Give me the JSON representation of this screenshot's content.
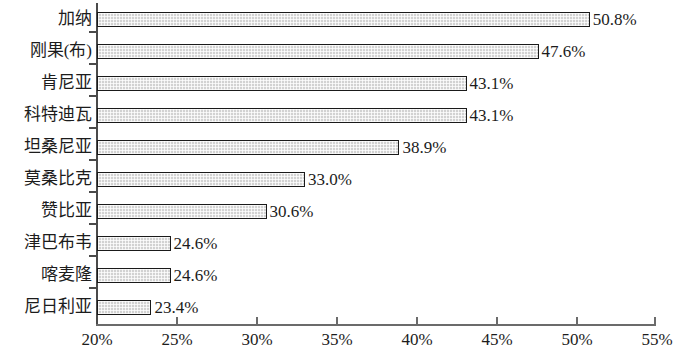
{
  "chart_data": {
    "type": "bar",
    "orientation": "horizontal",
    "title": "",
    "subtitle": "",
    "xlabel": "",
    "ylabel": "",
    "xlim": [
      20,
      55
    ],
    "xticks": [
      20,
      25,
      30,
      35,
      40,
      45,
      50,
      55
    ],
    "xtick_labels": [
      "20%",
      "25%",
      "30%",
      "35%",
      "40%",
      "45%",
      "50%",
      "55%"
    ],
    "grid": false,
    "legend": null,
    "categories": [
      "加纳",
      "刚果(布)",
      "肯尼亚",
      "科特迪瓦",
      "坦桑尼亚",
      "莫桑比克",
      "赞比亚",
      "津巴布韦",
      "喀麦隆",
      "尼日利亚"
    ],
    "values": [
      50.8,
      47.6,
      43.1,
      43.1,
      38.9,
      33.0,
      30.6,
      24.6,
      24.6,
      23.4
    ],
    "value_labels": [
      "50.8%",
      "47.6%",
      "43.1%",
      "43.1%",
      "38.9%",
      "33.0%",
      "30.6%",
      "24.6%",
      "24.6%",
      "23.4%"
    ],
    "bars": [
      {
        "category": "加纳",
        "value": 50.8,
        "label": "50.8%"
      },
      {
        "category": "刚果(布)",
        "value": 47.6,
        "label": "47.6%"
      },
      {
        "category": "肯尼亚",
        "value": 43.1,
        "label": "43.1%"
      },
      {
        "category": "科特迪瓦",
        "value": 43.1,
        "label": "43.1%"
      },
      {
        "category": "坦桑尼亚",
        "value": 38.9,
        "label": "38.9%"
      },
      {
        "category": "莫桑比克",
        "value": 33.0,
        "label": "33.0%"
      },
      {
        "category": "赞比亚",
        "value": 30.6,
        "label": "30.6%"
      },
      {
        "category": "津巴布韦",
        "value": 24.6,
        "label": "24.6%"
      },
      {
        "category": "喀麦隆",
        "value": 24.6,
        "label": "24.6%"
      },
      {
        "category": "尼日利亚",
        "value": 23.4,
        "label": "23.4%"
      }
    ],
    "colors": {
      "bar_fill": "#d2d2d2",
      "bar_border": "#1a1a1a",
      "axis": "#4a4a4a",
      "text": "#1c1c1c",
      "background": "#ffffff"
    }
  }
}
